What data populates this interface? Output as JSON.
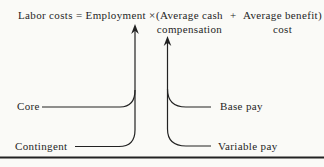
{
  "figure": {
    "formula": {
      "lead": "Labor costs = Employment ×",
      "cash_term": {
        "line1": "(Average cash",
        "line2": "compensation"
      },
      "plus": "+",
      "benefit_term": {
        "line1": "Average benefit)",
        "line2": "cost"
      }
    },
    "left_branch": {
      "top_label": "Core",
      "bottom_label": "Contingent"
    },
    "right_branch": {
      "top_label": "Base pay",
      "bottom_label": "Variable pay"
    }
  },
  "colors": {
    "background": "#fafaf7",
    "ink": "#222222"
  }
}
